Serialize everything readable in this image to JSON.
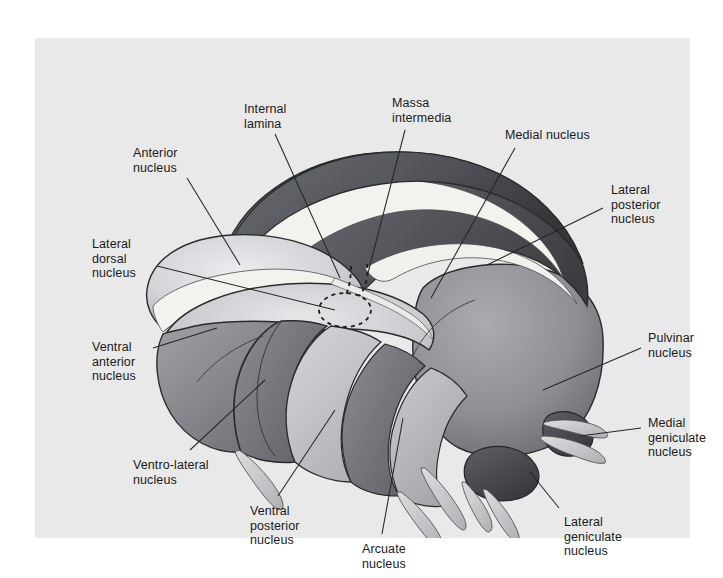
{
  "figure": {
    "kind": "anatomical-illustration",
    "background_color": "#e9e9e9",
    "page_color": "#ffffff",
    "leader_line_color": "#262626",
    "label_text_color": "#1a1a1a"
  },
  "palette": {
    "dark_band": "#5d5f63",
    "dark_band_shadow": "#3b3d41",
    "mid_gray": "#8f9196",
    "light_gray": "#c4c6ca",
    "pale_gray": "#d8dade",
    "lamina_white": "#f2f2ef",
    "outline": "#2a2a2a",
    "pulvinar": "#939599",
    "geniculate_dark": "#4a4c50",
    "nerve_pale": "#d2d4d6"
  },
  "labels": [
    {
      "id": "anterior-nucleus",
      "text": "Anterior\nnucleus",
      "x": 98,
      "y": 108,
      "align": "left"
    },
    {
      "id": "internal-lamina",
      "text": "Internal\nlamina",
      "x": 209,
      "y": 64,
      "align": "left"
    },
    {
      "id": "massa-intermedia",
      "text": "Massa\nintermedia",
      "x": 357,
      "y": 58,
      "align": "left"
    },
    {
      "id": "medial-nucleus",
      "text": "Medial nucleus",
      "x": 470,
      "y": 90,
      "align": "left"
    },
    {
      "id": "lateral-posterior-nucleus",
      "text": "Lateral\nposterior\nnucleus",
      "x": 576,
      "y": 145,
      "align": "left"
    },
    {
      "id": "lateral-dorsal-nucleus",
      "text": "Lateral\ndorsal\nnucleus",
      "x": 57,
      "y": 199,
      "align": "left"
    },
    {
      "id": "ventral-anterior-nucleus",
      "text": "Ventral\nanterior\nnucleus",
      "x": 57,
      "y": 302,
      "align": "left"
    },
    {
      "id": "pulvinar-nucleus",
      "text": "Pulvinar\nnucleus",
      "x": 613,
      "y": 293,
      "align": "left"
    },
    {
      "id": "medial-geniculate-nucleus",
      "text": "Medial\ngeniculate\nnucleus",
      "x": 613,
      "y": 378,
      "align": "left"
    },
    {
      "id": "ventro-lateral-nucleus",
      "text": "Ventro-lateral\nnucleus",
      "x": 98,
      "y": 420,
      "align": "left"
    },
    {
      "id": "ventral-posterior-nucleus",
      "text": "Ventral\nposterior\nnucleus",
      "x": 215,
      "y": 466,
      "align": "left"
    },
    {
      "id": "arcuate-nucleus",
      "text": "Arcuate\nnucleus",
      "x": 327,
      "y": 504,
      "align": "left"
    },
    {
      "id": "lateral-geniculate-nucleus",
      "text": "Lateral\ngeniculate\nnucleus",
      "x": 529,
      "y": 477,
      "align": "left"
    }
  ],
  "leader_lines": [
    {
      "id": "leader-anterior-nucleus",
      "x1": 152,
      "y1": 140,
      "x2": 205,
      "y2": 227
    },
    {
      "id": "leader-internal-lamina",
      "x1": 240,
      "y1": 96,
      "x2": 305,
      "y2": 240
    },
    {
      "id": "leader-massa-intermedia",
      "x1": 370,
      "y1": 92,
      "x2": 333,
      "y2": 235
    },
    {
      "id": "leader-medial-nucleus",
      "x1": 480,
      "y1": 110,
      "x2": 396,
      "y2": 260
    },
    {
      "id": "leader-lateral-posterior-nucleus",
      "x1": 568,
      "y1": 170,
      "x2": 452,
      "y2": 227
    },
    {
      "id": "leader-lateral-dorsal-nucleus",
      "x1": 122,
      "y1": 228,
      "x2": 300,
      "y2": 272
    },
    {
      "id": "leader-ventral-anterior-nucleus",
      "x1": 118,
      "y1": 310,
      "x2": 182,
      "y2": 290
    },
    {
      "id": "leader-pulvinar-nucleus",
      "x1": 606,
      "y1": 310,
      "x2": 508,
      "y2": 352
    },
    {
      "id": "leader-medial-geniculate-nucleus",
      "x1": 606,
      "y1": 390,
      "x2": 545,
      "y2": 398
    },
    {
      "id": "leader-ventro-lateral-nucleus",
      "x1": 155,
      "y1": 412,
      "x2": 230,
      "y2": 342
    },
    {
      "id": "leader-ventral-posterior-nucleus",
      "x1": 243,
      "y1": 458,
      "x2": 300,
      "y2": 372
    },
    {
      "id": "leader-arcuate-nucleus",
      "x1": 347,
      "y1": 496,
      "x2": 368,
      "y2": 380
    },
    {
      "id": "leader-lateral-geniculate-nucleus",
      "x1": 524,
      "y1": 470,
      "x2": 495,
      "y2": 434
    }
  ]
}
